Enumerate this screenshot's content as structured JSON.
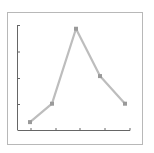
{
  "chart_data": {
    "type": "line",
    "title": "",
    "xlabel": "",
    "ylabel": "",
    "x": [
      1,
      2,
      3,
      4,
      5
    ],
    "categories": [
      "1",
      "2",
      "3",
      "4",
      "5"
    ],
    "series": [
      {
        "name": "series-1",
        "values": [
          0.3,
          1.0,
          3.85,
          2.05,
          1.0
        ]
      }
    ],
    "ylim": [
      0,
      4
    ],
    "y_ticks": [
      1,
      2,
      3,
      4
    ],
    "x_tick_count": 4,
    "tick_labels_visible": false,
    "grid": false,
    "legend": null,
    "colors": {
      "line": "#bdbdbd",
      "marker": "#9a9a9a",
      "axis": "#555555",
      "frame": "#b8b8b8"
    }
  }
}
